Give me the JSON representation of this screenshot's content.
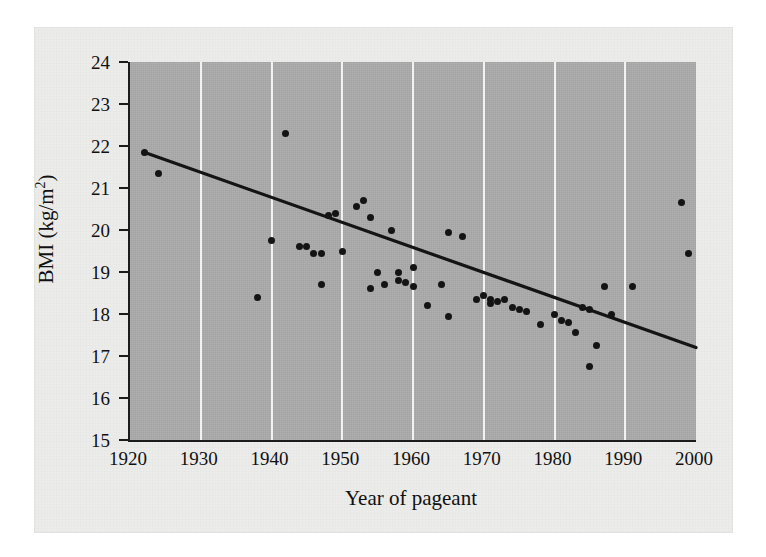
{
  "figure": {
    "background_color": "#ececea",
    "plot_background_color": "#a8a8a8",
    "gridline_color": "#f2f2f0",
    "axis_color": "#1c1c1c",
    "point_color": "#141414",
    "trend_color": "#141414"
  },
  "chart_data": {
    "type": "scatter",
    "title": "",
    "xlabel": "Year of pageant",
    "ylabel": "BMI (kg/m²)",
    "ylabel_parts": {
      "base": "BMI (kg/m",
      "superscript": "2",
      "close": ")"
    },
    "xlim": [
      1920,
      2000
    ],
    "ylim": [
      15,
      24
    ],
    "xticks": [
      1920,
      1930,
      1940,
      1950,
      1960,
      1970,
      1980,
      1990,
      2000
    ],
    "yticks": [
      15,
      16,
      17,
      18,
      19,
      20,
      21,
      22,
      23,
      24
    ],
    "gridlines": {
      "vertical_at": [
        1930,
        1940,
        1950,
        1960,
        1970,
        1980,
        1990
      ],
      "horizontal": false
    },
    "legend": null,
    "points": [
      {
        "x": 1922,
        "y": 21.85
      },
      {
        "x": 1924,
        "y": 21.35
      },
      {
        "x": 1938,
        "y": 18.4
      },
      {
        "x": 1940,
        "y": 19.75
      },
      {
        "x": 1942,
        "y": 22.3
      },
      {
        "x": 1944,
        "y": 19.6
      },
      {
        "x": 1945,
        "y": 19.6
      },
      {
        "x": 1946,
        "y": 19.45
      },
      {
        "x": 1947,
        "y": 19.45
      },
      {
        "x": 1947,
        "y": 18.7
      },
      {
        "x": 1948,
        "y": 20.35
      },
      {
        "x": 1949,
        "y": 20.4
      },
      {
        "x": 1950,
        "y": 19.5
      },
      {
        "x": 1952,
        "y": 20.55
      },
      {
        "x": 1953,
        "y": 20.7
      },
      {
        "x": 1954,
        "y": 20.3
      },
      {
        "x": 1954,
        "y": 18.6
      },
      {
        "x": 1955,
        "y": 19.0
      },
      {
        "x": 1956,
        "y": 18.7
      },
      {
        "x": 1957,
        "y": 20.0
      },
      {
        "x": 1958,
        "y": 19.0
      },
      {
        "x": 1958,
        "y": 18.8
      },
      {
        "x": 1959,
        "y": 18.75
      },
      {
        "x": 1960,
        "y": 19.1
      },
      {
        "x": 1960,
        "y": 18.65
      },
      {
        "x": 1962,
        "y": 18.2
      },
      {
        "x": 1964,
        "y": 18.7
      },
      {
        "x": 1965,
        "y": 19.95
      },
      {
        "x": 1965,
        "y": 17.95
      },
      {
        "x": 1967,
        "y": 19.85
      },
      {
        "x": 1969,
        "y": 18.35
      },
      {
        "x": 1970,
        "y": 18.45
      },
      {
        "x": 1971,
        "y": 18.35
      },
      {
        "x": 1971,
        "y": 18.25
      },
      {
        "x": 1972,
        "y": 18.3
      },
      {
        "x": 1973,
        "y": 18.35
      },
      {
        "x": 1974,
        "y": 18.15
      },
      {
        "x": 1975,
        "y": 18.1
      },
      {
        "x": 1976,
        "y": 18.05
      },
      {
        "x": 1978,
        "y": 17.75
      },
      {
        "x": 1980,
        "y": 18.0
      },
      {
        "x": 1981,
        "y": 17.85
      },
      {
        "x": 1982,
        "y": 17.8
      },
      {
        "x": 1983,
        "y": 17.55
      },
      {
        "x": 1984,
        "y": 18.15
      },
      {
        "x": 1985,
        "y": 18.1
      },
      {
        "x": 1985,
        "y": 16.75
      },
      {
        "x": 1986,
        "y": 17.25
      },
      {
        "x": 1987,
        "y": 18.65
      },
      {
        "x": 1988,
        "y": 18.0
      },
      {
        "x": 1991,
        "y": 18.65
      },
      {
        "x": 1998,
        "y": 20.65
      },
      {
        "x": 1999,
        "y": 19.45
      }
    ],
    "trend_line": {
      "x_start": 1922,
      "y_start": 21.85,
      "x_end": 2000,
      "y_end": 17.2
    }
  }
}
